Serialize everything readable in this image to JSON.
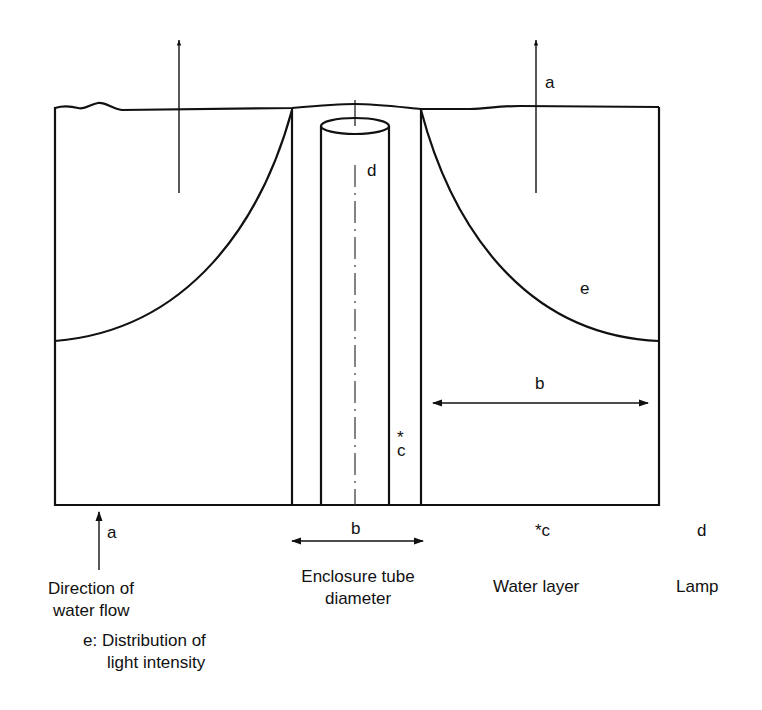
{
  "diagram": {
    "inline_labels": {
      "flow_arrow_label": "a",
      "lamp_label": "d",
      "curve_label": "e",
      "water_layer_width_label": "b",
      "water_layer_label_star": "*",
      "water_layer_label_c": "c"
    },
    "legend": {
      "a_marker": "a",
      "a_text_line1": "Direction of",
      "a_text_line2": "water flow",
      "b_marker": "b",
      "b_text_line1": "Enclosure tube",
      "b_text_line2": "diameter",
      "c_marker": "*c",
      "c_text": "Water layer",
      "d_marker": "d",
      "d_text": "Lamp",
      "e_text_line1": "e: Distribution of",
      "e_text_line2": "light intensity"
    },
    "colors": {
      "line": "#111111",
      "background": "#ffffff"
    }
  }
}
